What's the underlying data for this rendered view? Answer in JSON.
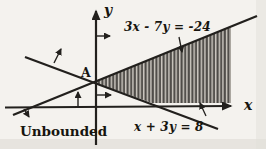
{
  "figure": {
    "y_axis_label": "y",
    "x_axis_label": "x",
    "line1_equation": "3x - 7y = -24",
    "line2_equation": "x + 3y = 8",
    "point_label": "A",
    "region_label": "Unbounded"
  },
  "colors": {
    "paper": "#f4f2ee",
    "ink": "#22201d",
    "hatch_dark": "#3d3a36",
    "hatch_light": "#ccc7bf"
  }
}
